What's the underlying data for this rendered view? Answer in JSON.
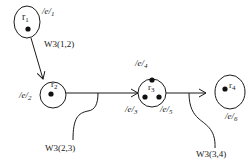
{
  "diagram": {
    "nodes": [
      {
        "id": "r1",
        "label": "r",
        "sub": "1",
        "edge_label": "/e/",
        "edge_sub": "1",
        "dots": 1
      },
      {
        "id": "r2",
        "label": "r",
        "sub": "2",
        "edge_label": "/e/",
        "edge_sub": "2",
        "dots": 1
      },
      {
        "id": "r3",
        "label": "r",
        "sub": "3",
        "edge_labels": [
          {
            "text": "/e/",
            "sub": "3"
          },
          {
            "text": "/e/",
            "sub": "4"
          },
          {
            "text": "/e/",
            "sub": "5"
          }
        ],
        "dots": 3
      },
      {
        "id": "r4",
        "label": "r",
        "sub": "4",
        "edge_label": "/e/",
        "edge_sub": "6",
        "dots": 1
      }
    ],
    "connections": [
      {
        "from": "r1",
        "to": "r2",
        "label": "W3(1,2)"
      },
      {
        "from": "r2",
        "to": "r3",
        "label": "W3(2,3)"
      },
      {
        "from": "r3",
        "to": "r4",
        "label": "W3(3,4)"
      }
    ],
    "colors": {
      "stroke": "#1a1a1a",
      "background": "#ffffff"
    }
  }
}
